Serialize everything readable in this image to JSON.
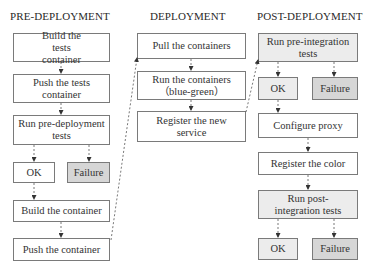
{
  "columns": {
    "pre": {
      "title": "PRE-DEPLOYMENT",
      "steps": {
        "build_tests": "Build the tests container",
        "push_tests": "Push the tests container",
        "run_tests": "Run pre-deployment tests",
        "ok": "OK",
        "failure": "Failure",
        "build_container": "Build the container",
        "push_container": "Push the container"
      }
    },
    "deploy": {
      "title": "DEPLOYMENT",
      "steps": {
        "pull": "Pull the containers",
        "run": "Run the containers （blue-green）",
        "register": "Register the new service"
      }
    },
    "post": {
      "title": "POST-DEPLOYMENT",
      "steps": {
        "pre_integration": "Run pre-integration tests",
        "ok1": "OK",
        "failure1": "Failure",
        "proxy": "Configure proxy",
        "color": "Register the color",
        "post_integration": "Run post-integration tests",
        "ok2": "OK",
        "failure2": "Failure"
      }
    }
  },
  "colors": {
    "box_border": "#7a7a7a",
    "neutral_fill": "#ffffff",
    "test_fill": "#ececec",
    "failure_fill": "#d6d6d6",
    "arrow": "#555555"
  }
}
